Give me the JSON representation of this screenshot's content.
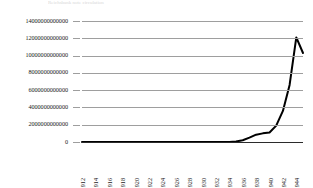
{
  "title_strip": "Reichsbank note circulation",
  "chart_data": {
    "type": "line",
    "title": "",
    "subtitle": "",
    "xlabel": "",
    "ylabel": "",
    "grid": true,
    "legend": false,
    "legend_position": "none",
    "line_color": "#000000",
    "gridline_color": "#9e9e9e",
    "axis_color": "#2b2b2b",
    "xlim": [
      1912,
      1945
    ],
    "ylim": [
      0,
      14000000000000
    ],
    "ytick_labels": [
      "14000000000000",
      "12000000000000",
      "10000000000000",
      "8000000000000",
      "6000000000000",
      "4000000000000",
      "2000000000000",
      "0"
    ],
    "ytick_values": [
      14000000000000,
      12000000000000,
      10000000000000,
      8000000000000,
      6000000000000,
      4000000000000,
      2000000000000,
      0
    ],
    "xtick_labels": [
      "1912",
      "1914",
      "1916",
      "1918",
      "1920",
      "1922",
      "1924",
      "1926",
      "1928",
      "1930",
      "1932",
      "1934",
      "1936",
      "1938",
      "1940",
      "1942",
      "1944"
    ],
    "xtick_values": [
      1912,
      1914,
      1916,
      1918,
      1920,
      1922,
      1924,
      1926,
      1928,
      1930,
      1932,
      1934,
      1936,
      1938,
      1940,
      1942,
      1944
    ],
    "series": [
      {
        "name": "Series 1",
        "x": [
          1912,
          1913,
          1914,
          1915,
          1916,
          1917,
          1918,
          1919,
          1920,
          1921,
          1922,
          1923,
          1924,
          1925,
          1926,
          1927,
          1928,
          1929,
          1930,
          1931,
          1932,
          1933,
          1934,
          1935,
          1936,
          1937,
          1938,
          1939,
          1940,
          1941,
          1942,
          1943,
          1944,
          1945
        ],
        "values": [
          0,
          0,
          0,
          0,
          0,
          0,
          0,
          0,
          0,
          0,
          0,
          0,
          0,
          0,
          0,
          0,
          0,
          0,
          0,
          0,
          0,
          0,
          0,
          60000000000,
          200000000000,
          500000000000,
          850000000000,
          1000000000000,
          1100000000000,
          1900000000000,
          3600000000000,
          6600000000000,
          12100000000000,
          10300000000000
        ]
      }
    ]
  }
}
